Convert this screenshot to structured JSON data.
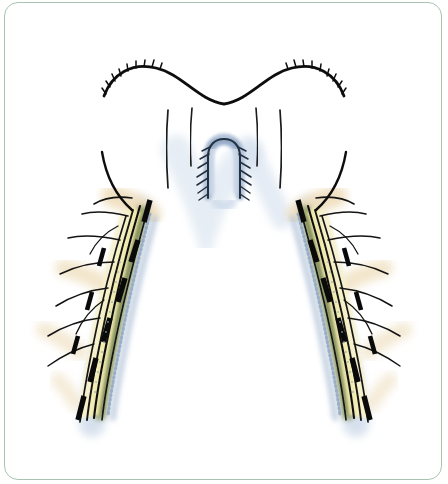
{
  "figure": {
    "domain": "anatomical-illustration",
    "description": "Line-and-wash medical drawing of a symmetric arched structure with a central U-shaped element and two descending lateral limbs bearing nerve bundles and dashed surgical markings",
    "background_color": "#ffffff",
    "frame": {
      "border_color": "#a8c4b0",
      "border_width_px": 1.2,
      "corner_radius_px": 14,
      "inset_px": 4
    }
  },
  "palette": {
    "ink_black": "#0d0d0d",
    "ink_soft": "#2b2b2b",
    "nerve_cream": "#f4edb4",
    "nerve_cream_pale": "#f7f1cf",
    "tan_wash": "#efdcb8",
    "olive_green": "#8e9a62",
    "olive_green_dark": "#74814f",
    "blue_gray": "#aebfd6",
    "blue_gray_deep": "#8fa6c4",
    "blue_shadow": "#c9d7e8",
    "frame_green": "#a8c4b0",
    "white": "#ffffff"
  },
  "structures": {
    "top_contour": {
      "name": "superior-wavy-margin",
      "label": "Superior tissue margin",
      "stroke": "#0d0d0d",
      "stroke_width": 2.6,
      "hatch_marks_left": 9,
      "hatch_marks_right": 9,
      "hatch_note": "Short tick marks along the upper edge of each shoulder of the wave"
    },
    "central_u": {
      "name": "central-u-structure",
      "label": "Central U-shaped sutured structure",
      "fill": "#aebfd6",
      "stroke": "#2b2b2b",
      "suture_pairs": 7,
      "suture_note": "Angled suture ticks descending outward on both limbs of the U"
    },
    "inner_verticals": {
      "name": "inner-vertical-lines",
      "count": 4,
      "stroke": "#1a1a1a",
      "stroke_width": 1.6
    },
    "left_limb": {
      "name": "left-descending-limb",
      "label": "Left lateral limb",
      "nerve_bands": 3,
      "dashed_markings": 6,
      "branch_strokes": 9,
      "shading": [
        "#f4edb4",
        "#8e9a62",
        "#aebfd6"
      ]
    },
    "right_limb": {
      "name": "right-descending-limb",
      "label": "Right lateral limb",
      "nerve_bands": 3,
      "dashed_markings": 6,
      "branch_strokes": 9,
      "shading": [
        "#f4edb4",
        "#8e9a62",
        "#aebfd6"
      ]
    }
  },
  "annotations": {
    "visible_text": [],
    "note": "No textual labels, legends, axis ticks, numbers or captions are rendered anywhere in this image"
  }
}
